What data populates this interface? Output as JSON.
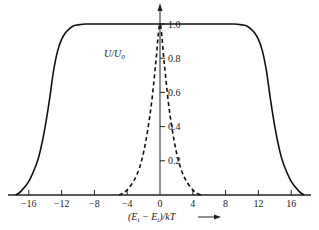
{
  "chart_data": {
    "type": "line",
    "title": "",
    "xlabel": "(E_t − E_i)/kT",
    "xlabel_parts": {
      "open": "(E",
      "sub1": "t",
      "mid": " − E",
      "sub2": "i",
      "close": ")/kT"
    },
    "ylabel": "U/U_0",
    "ylabel_parts": {
      "main": "U/U",
      "sub": "0"
    },
    "xlim": [
      -18,
      18
    ],
    "ylim": [
      0,
      1.0
    ],
    "xticks": [
      -16,
      -12,
      -8,
      -4,
      0,
      4,
      8,
      12,
      16
    ],
    "xtick_labels": [
      "−16",
      "−12",
      "−8",
      "−4",
      "0",
      "4",
      "8",
      "12",
      "16"
    ],
    "yticks": [
      0.2,
      0.4,
      0.6,
      0.8,
      1.0
    ],
    "ytick_labels": [
      "0.2",
      "0.4",
      "0.6",
      "0.8",
      "1.0"
    ],
    "grid": false,
    "legend": "none",
    "series": [
      {
        "name": "solid",
        "style": "solid",
        "x": [
          -17.6,
          -17,
          -16,
          -15,
          -14.5,
          -14,
          -13.5,
          -13,
          -12.5,
          -12,
          -11.5,
          -11,
          -10.5,
          -10,
          -9,
          -8,
          -4,
          0,
          4,
          8,
          9,
          10,
          10.5,
          11,
          11.5,
          12,
          12.5,
          13,
          13.5,
          14,
          14.5,
          15,
          16,
          17,
          17.6
        ],
        "y": [
          0.0,
          0.02,
          0.08,
          0.19,
          0.28,
          0.4,
          0.55,
          0.72,
          0.84,
          0.91,
          0.95,
          0.975,
          0.99,
          0.995,
          1.0,
          1.0,
          1.0,
          1.0,
          1.0,
          1.0,
          1.0,
          0.995,
          0.99,
          0.975,
          0.95,
          0.91,
          0.84,
          0.72,
          0.55,
          0.4,
          0.28,
          0.19,
          0.08,
          0.02,
          0.0
        ]
      },
      {
        "name": "dashed",
        "style": "dashed",
        "x": [
          -5,
          -4.5,
          -4,
          -3.5,
          -3,
          -2.5,
          -2,
          -1.5,
          -1,
          -0.5,
          0,
          0.5,
          1,
          1.5,
          2,
          2.5,
          3,
          3.5,
          4,
          4.5,
          5
        ],
        "y": [
          0.0,
          0.01,
          0.03,
          0.06,
          0.1,
          0.16,
          0.25,
          0.38,
          0.55,
          0.78,
          1.0,
          0.78,
          0.55,
          0.38,
          0.25,
          0.16,
          0.1,
          0.06,
          0.03,
          0.01,
          0.0
        ]
      }
    ]
  }
}
